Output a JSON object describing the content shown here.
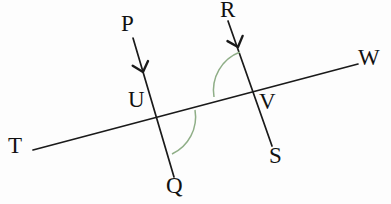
{
  "figure": {
    "background_color": "#fdfdfd",
    "line_color": "#1a1a1a",
    "arc_color": "#8fae87",
    "label_color": "#111111"
  },
  "labels": [
    {
      "id": "P",
      "text": "P",
      "x": 121,
      "y": 12,
      "name": "point-label-p"
    },
    {
      "id": "R",
      "text": "R",
      "x": 220,
      "y": -2,
      "name": "point-label-r"
    },
    {
      "id": "W",
      "text": "W",
      "x": 358,
      "y": 46,
      "name": "point-label-w"
    },
    {
      "id": "U",
      "text": "U",
      "x": 128,
      "y": 88,
      "name": "point-label-u"
    },
    {
      "id": "V",
      "text": "V",
      "x": 259,
      "y": 90,
      "name": "point-label-v"
    },
    {
      "id": "T",
      "text": "T",
      "x": 8,
      "y": 134,
      "name": "point-label-t"
    },
    {
      "id": "S",
      "text": "S",
      "x": 269,
      "y": 144,
      "name": "point-label-s"
    },
    {
      "id": "Q",
      "text": "Q",
      "x": 166,
      "y": 174,
      "name": "point-label-q"
    }
  ],
  "lines": [
    {
      "id": "TW",
      "name": "line-tw",
      "from_label": "T",
      "to_label": "W",
      "x1": 33,
      "y1": 150,
      "x2": 358,
      "y2": 64
    },
    {
      "id": "PQ",
      "name": "line-pq",
      "from_label": "P",
      "to_label": "Q",
      "x1": 133,
      "y1": 38,
      "x2": 174,
      "y2": 177
    },
    {
      "id": "RS",
      "name": "line-rs",
      "from_label": "R",
      "to_label": "S",
      "x1": 228,
      "y1": 21,
      "x2": 272,
      "y2": 146
    }
  ],
  "arrow_marks": [
    {
      "id": "arrow-pq",
      "name": "arrow-marker-pq",
      "x": 143,
      "y": 72,
      "angle": 73
    },
    {
      "id": "arrow-rs",
      "name": "arrow-marker-rs",
      "x": 238,
      "y": 47,
      "angle": 71
    }
  ],
  "intersections": [
    {
      "id": "U",
      "name": "intersection-point-u",
      "x": 155,
      "y": 114,
      "lines": "TW,PQ"
    },
    {
      "id": "V",
      "name": "intersection-point-v",
      "x": 254,
      "y": 90,
      "lines": "TW,RS"
    }
  ],
  "angle_arcs": [
    {
      "id": "angle-u",
      "name": "angle-arc-u",
      "vertex": "U",
      "path": "M 195 110 A 41 41 0 0 1 172 154",
      "description": "angle at U between ray UW and ray UQ"
    },
    {
      "id": "angle-v",
      "name": "angle-arc-v",
      "vertex": "V",
      "path": "M 240 52 A 41 41 0 0 0 214 97",
      "description": "angle at V between ray VR and ray VT"
    }
  ]
}
